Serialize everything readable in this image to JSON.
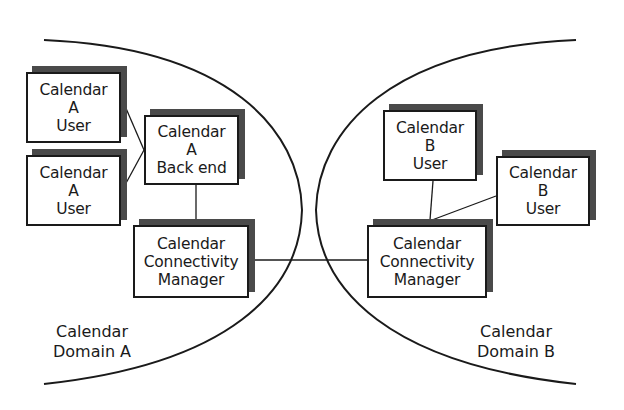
{
  "diagram": {
    "domains": [
      {
        "id": "domain-a",
        "label": [
          "Calendar",
          "Domain A"
        ],
        "nodes": [
          {
            "id": "a-user-1",
            "lines": [
              "Calendar",
              "A",
              "User"
            ]
          },
          {
            "id": "a-user-2",
            "lines": [
              "Calendar",
              "A",
              "User"
            ]
          },
          {
            "id": "a-backend",
            "lines": [
              "Calendar",
              "A",
              "Back end"
            ]
          },
          {
            "id": "a-ccm",
            "lines": [
              "Calendar",
              "Connectivity",
              "Manager"
            ]
          }
        ]
      },
      {
        "id": "domain-b",
        "label": [
          "Calendar",
          "Domain B"
        ],
        "nodes": [
          {
            "id": "b-user-1",
            "lines": [
              "Calendar",
              "B",
              "User"
            ]
          },
          {
            "id": "b-user-2",
            "lines": [
              "Calendar",
              "B",
              "User"
            ]
          },
          {
            "id": "b-ccm",
            "lines": [
              "Calendar",
              "Connectivity",
              "Manager"
            ]
          }
        ]
      }
    ],
    "edges": [
      [
        "a-user-1",
        "a-backend"
      ],
      [
        "a-user-2",
        "a-backend"
      ],
      [
        "a-backend",
        "a-ccm"
      ],
      [
        "a-ccm",
        "b-ccm"
      ],
      [
        "b-user-1",
        "b-ccm"
      ],
      [
        "b-user-2",
        "b-ccm"
      ]
    ],
    "colors": {
      "stroke": "#1a1a1a",
      "shadow": "#4a4a4a",
      "background": "#ffffff"
    }
  }
}
